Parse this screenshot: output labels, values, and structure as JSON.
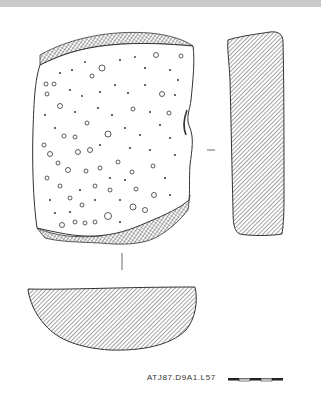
{
  "figure": {
    "caption": "ATJ87.D9A1.L57",
    "views": [
      {
        "id": "face-view",
        "label": "Face view (pitted stone surface)"
      },
      {
        "id": "side-profile",
        "label": "Side profile (hatched)"
      },
      {
        "id": "cross-section",
        "label": "Cross-section (hatched, semicircular)"
      }
    ],
    "scale_bar": {
      "segments": 5
    }
  },
  "colors": {
    "top_band": "#c9c9c9",
    "line": "#333333",
    "hatch": "#555555",
    "background": "#ffffff"
  }
}
